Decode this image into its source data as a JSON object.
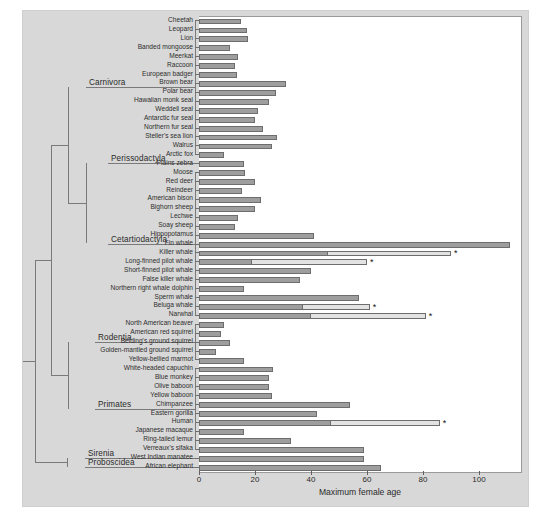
{
  "chart_data": {
    "type": "bar",
    "orientation": "horizontal",
    "title": "",
    "xlabel": "Maximum female age",
    "ylabel": "",
    "xlim": [
      0,
      115
    ],
    "xticks": [
      0,
      20,
      40,
      60,
      80,
      100
    ],
    "grid": false,
    "legend": [
      {
        "name": "Reproductive lifespan",
        "color": "#9e9e9e"
      },
      {
        "name": "Post-reproductive lifespan",
        "color": "#e2e2e2"
      }
    ],
    "annotation_marker": "*",
    "annotation_meaning": "significant post-reproductive lifespan",
    "categories": [
      "Cheetah",
      "Leopard",
      "Lion",
      "Banded mongoose",
      "Meerkat",
      "Raccoon",
      "European badger",
      "Brown bear",
      "Polar bear",
      "Hawaiian monk seal",
      "Weddell seal",
      "Antarctic fur seal",
      "Northern fur seal",
      "Steller's sea lion",
      "Walrus",
      "Arctic fox",
      "Plains zebra",
      "Moose",
      "Red deer",
      "Reindeer",
      "American bison",
      "Bighorn sheep",
      "Lechwe",
      "Soay sheep",
      "Hippopotamus",
      "Fin whale",
      "Killer whale",
      "Long-finned pilot whale",
      "Short-finned pilot whale",
      "False killer whale",
      "Northern right whale dolphin",
      "Sperm whale",
      "Beluga whale",
      "Narwhal",
      "North American beaver",
      "American red squirrel",
      "Belding's ground squirrel",
      "Golden-mantled ground squirrel",
      "Yellow-bellied marmot",
      "White-headed capuchin",
      "Blue monkey",
      "Olive baboon",
      "Yellow baboon",
      "Chimpanzee",
      "Eastern gorilla",
      "Human",
      "Japanese macaque",
      "Ring-tailed lemur",
      "Verreaux's sifaka",
      "West Indian manatee",
      "African elephant"
    ],
    "series": [
      {
        "name": "Reproductive lifespan",
        "color": "#9e9e9e",
        "values": [
          15,
          17,
          17.5,
          11,
          14,
          13,
          13.5,
          31,
          27.5,
          25,
          21,
          20,
          23,
          28,
          26,
          9,
          16,
          16.5,
          20,
          15.5,
          22,
          20,
          14,
          13,
          41,
          111,
          46,
          19,
          40,
          36,
          16,
          57,
          37,
          40,
          9,
          8,
          11,
          6,
          16,
          26.5,
          25,
          25,
          26,
          54,
          42,
          47,
          16,
          33,
          59,
          59,
          65
        ]
      },
      {
        "name": "Post-reproductive lifespan",
        "color": "#e2e2e2",
        "values": [
          0,
          0,
          0,
          0,
          0,
          0,
          0,
          0,
          0,
          0,
          0,
          0,
          0,
          0,
          0,
          0,
          0,
          0,
          0,
          0,
          0,
          0,
          0,
          0,
          0,
          0,
          44,
          41,
          0,
          0,
          0,
          0,
          24,
          41,
          0,
          0,
          0,
          0,
          0,
          0,
          0,
          0,
          0,
          0,
          0,
          39,
          0,
          0,
          0,
          0,
          0
        ]
      }
    ],
    "starred_categories": [
      "Killer whale",
      "Long-finned pilot whale",
      "Beluga whale",
      "Narwhal",
      "Human"
    ]
  },
  "tree": {
    "clades": [
      {
        "label": "Carnivora"
      },
      {
        "label": "Perissodactyla"
      },
      {
        "label": "Cetartiodactyla"
      },
      {
        "label": "Rodentia"
      },
      {
        "label": "Primates"
      },
      {
        "label": "Sirenia"
      },
      {
        "label": "Proboscidea"
      }
    ]
  },
  "axis": {
    "title": "Maximum female age",
    "tick_labels": [
      "0",
      "20",
      "40",
      "60",
      "80",
      "100"
    ]
  }
}
